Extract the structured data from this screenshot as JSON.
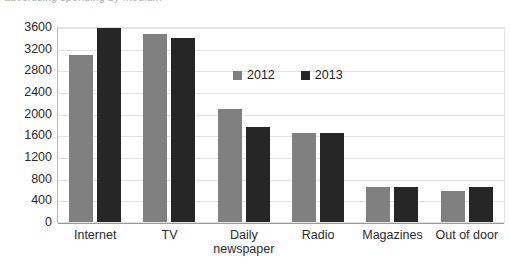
{
  "title_strip": {
    "text": "advertising spending by medium"
  },
  "legend": {
    "position": "inside-top-center",
    "items": [
      {
        "label": "2012",
        "color": "#808080",
        "swatch_name": "legend-swatch-2012"
      },
      {
        "label": "2013",
        "color": "#262626",
        "swatch_name": "legend-swatch-2013"
      }
    ]
  },
  "axis": {
    "y_ticks": [
      "3600",
      "3200",
      "2800",
      "2400",
      "2000",
      "1600",
      "1200",
      "800",
      "400",
      "0"
    ]
  },
  "chart_data": {
    "type": "bar",
    "title": "",
    "xlabel": "",
    "ylabel": "",
    "ylim": [
      0,
      3600
    ],
    "ytick_step": 400,
    "grid": true,
    "legend_position": "inside-top-center",
    "categories": [
      "Internet",
      "Daily\nnewspaper",
      "TV",
      "Radio",
      "Magazines",
      "Out of door"
    ],
    "category_labels": [
      {
        "line1": "Internet",
        "line2": ""
      },
      {
        "line1": "TV",
        "line2": ""
      },
      {
        "line1": "Daily",
        "line2": "newspaper"
      },
      {
        "line1": "Radio",
        "line2": ""
      },
      {
        "line1": "Magazines",
        "line2": ""
      },
      {
        "line1": "Out of door",
        "line2": ""
      }
    ],
    "series": [
      {
        "name": "2012",
        "color": "#808080",
        "values": [
          3080,
          3480,
          2080,
          1640,
          650,
          580
        ]
      },
      {
        "name": "2013",
        "color": "#262626",
        "values": [
          3580,
          3400,
          1750,
          1650,
          650,
          650
        ]
      }
    ]
  }
}
